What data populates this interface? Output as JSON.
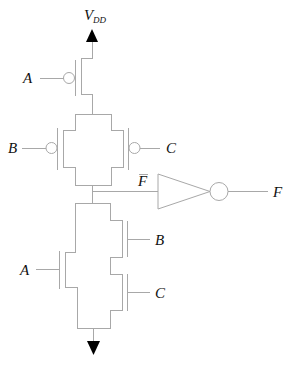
{
  "diagram": {
    "type": "CMOS logic gate schematic",
    "supply_label": {
      "main": "V",
      "subscript": "DD"
    },
    "pull_up_network": {
      "transistors": [
        {
          "type": "PMOS",
          "gate": "A",
          "arrangement": "series"
        },
        {
          "type": "PMOS",
          "gate": "B",
          "arrangement": "parallel"
        },
        {
          "type": "PMOS",
          "gate": "C",
          "arrangement": "parallel"
        }
      ]
    },
    "pull_down_network": {
      "transistors": [
        {
          "type": "NMOS",
          "gate": "A",
          "arrangement": "parallel"
        },
        {
          "type": "NMOS",
          "gate": "B",
          "arrangement": "series"
        },
        {
          "type": "NMOS",
          "gate": "C",
          "arrangement": "series"
        }
      ]
    },
    "labels": {
      "input_a_top": "A",
      "input_b_top": "B",
      "input_c_top": "C",
      "input_a_bottom": "A",
      "input_b_bottom": "B",
      "input_c_bottom": "C",
      "internal_node": "F",
      "output": "F"
    },
    "internal_node_negated": true,
    "inverter": {
      "input": "F̄",
      "output": "F"
    },
    "ground_symbol": "arrow-down"
  }
}
